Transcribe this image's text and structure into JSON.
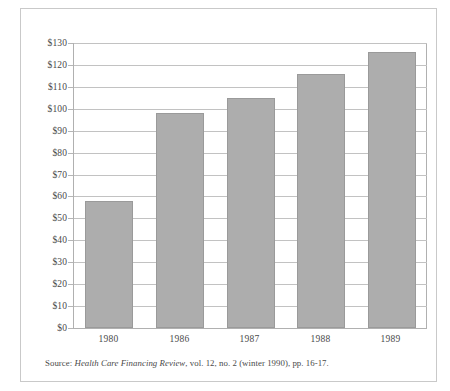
{
  "figure": {
    "source_prefix": "Source: ",
    "source_journal": "Health Care Financing Review",
    "source_suffix": ", vol. 12, no. 2 (winter 1990), pp. 16-17."
  },
  "colors": {
    "bar_fill": "#adadad",
    "bar_border": "#9a9a9a",
    "gridline": "#c2c2c2",
    "axis": "#b0b0b0",
    "frame": "#c9c9c9",
    "text": "#4a4a4a",
    "background": "#ffffff"
  },
  "chart_data": {
    "type": "bar",
    "title": "",
    "subtitle": "",
    "xlabel": "",
    "ylabel": "",
    "categories": [
      "1980",
      "1986",
      "1987",
      "1988",
      "1989"
    ],
    "values": [
      58,
      98,
      105,
      116,
      126
    ],
    "series": [
      {
        "name": "National health expenditures per capita",
        "values": [
          58,
          98,
          105,
          116,
          126
        ]
      }
    ],
    "ylim": [
      0,
      130
    ],
    "ytick_step": 10,
    "ytick_labels": [
      "$130",
      "$120",
      "$110",
      "$100",
      "$90",
      "$80",
      "$70",
      "$60",
      "$50",
      "$40",
      "$30",
      "$20",
      "$10",
      "$0"
    ],
    "ytick_values": [
      130,
      120,
      110,
      100,
      90,
      80,
      70,
      60,
      50,
      40,
      30,
      20,
      10,
      0
    ],
    "value_prefix": "$",
    "grid": true,
    "grid_axis": "y",
    "legend": false,
    "legend_position": "none",
    "annotations": []
  }
}
